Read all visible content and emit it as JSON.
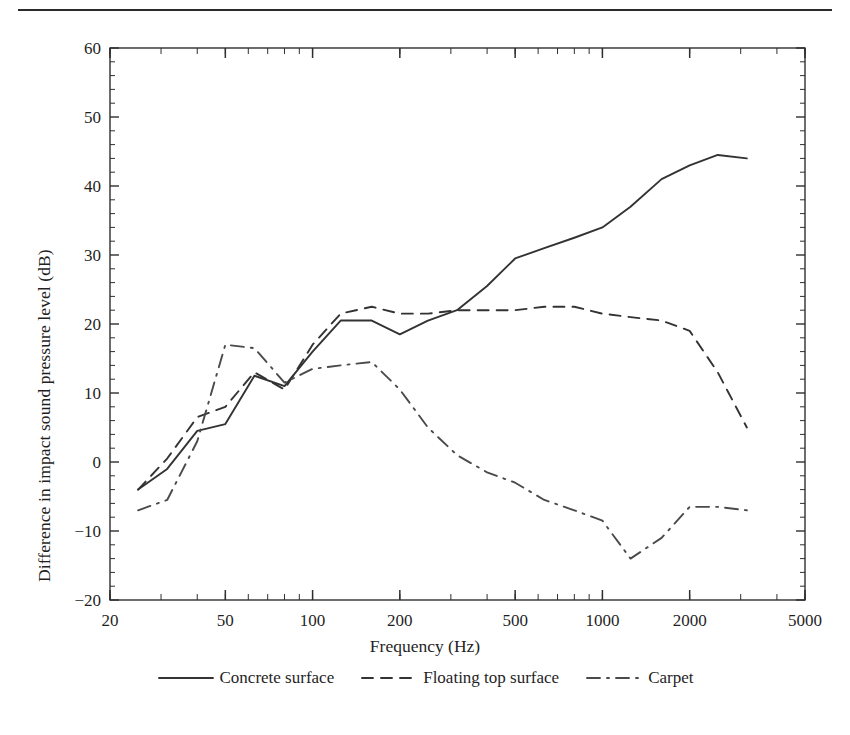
{
  "figure": {
    "xlabel": "Frequency (Hz)",
    "ylabel": "Difference in impact sound pressure level (dB)"
  },
  "legend": {
    "items": [
      {
        "label": "Concrete surface",
        "style": "solid"
      },
      {
        "label": "Floating top surface",
        "style": "dashed"
      },
      {
        "label": "Carpet",
        "style": "dashdot"
      }
    ]
  },
  "axis": {
    "y_ticks": [
      "-20",
      "-10",
      "0",
      "10",
      "20",
      "30",
      "40",
      "50",
      "60"
    ],
    "x_ticks": [
      "20",
      "50",
      "100",
      "200",
      "500",
      "1000",
      "2000",
      "5000"
    ]
  },
  "chart_data": {
    "type": "line",
    "title": "",
    "xlabel": "Frequency (Hz)",
    "ylabel": "Difference in impact sound pressure level (dB)",
    "xscale": "log",
    "xlim": [
      20,
      5000
    ],
    "ylim": [
      -20,
      60
    ],
    "ytick_values": [
      -20,
      -10,
      0,
      10,
      20,
      30,
      40,
      50,
      60
    ],
    "xtick_values": [
      20,
      50,
      100,
      200,
      500,
      1000,
      2000,
      5000
    ],
    "grid": false,
    "legend_position": "below-axes",
    "x": [
      25,
      31.5,
      40,
      50,
      63,
      80,
      100,
      125,
      160,
      200,
      250,
      315,
      400,
      500,
      630,
      800,
      1000,
      1250,
      1600,
      2000,
      2500,
      3150
    ],
    "series": [
      {
        "name": "Concrete surface",
        "style": "solid",
        "color": "#333333",
        "values": [
          -4.0,
          -1.0,
          4.5,
          5.5,
          12.5,
          11.0,
          16.0,
          20.5,
          20.5,
          18.5,
          20.5,
          22.0,
          25.5,
          29.5,
          31.0,
          32.5,
          34.0,
          37.0,
          41.0,
          43.0,
          44.5,
          44.0
        ]
      },
      {
        "name": "Floating top surface",
        "style": "dashed",
        "color": "#333333",
        "values": [
          -4.0,
          0.5,
          6.5,
          8.0,
          13.0,
          10.5,
          17.0,
          21.5,
          22.5,
          21.5,
          21.5,
          22.0,
          22.0,
          22.0,
          22.5,
          22.5,
          21.5,
          21.0,
          20.5,
          19.0,
          13.0,
          5.0
        ]
      },
      {
        "name": "Carpet",
        "style": "dashdot",
        "color": "#4a4a4a",
        "values": [
          -7.0,
          -5.5,
          3.0,
          17.0,
          16.5,
          11.5,
          13.5,
          14.0,
          14.5,
          10.5,
          5.0,
          1.0,
          -1.5,
          -3.0,
          -5.5,
          -7.0,
          -8.5,
          -14.0,
          -11.0,
          -6.5,
          -6.5,
          -7.0
        ]
      }
    ]
  }
}
